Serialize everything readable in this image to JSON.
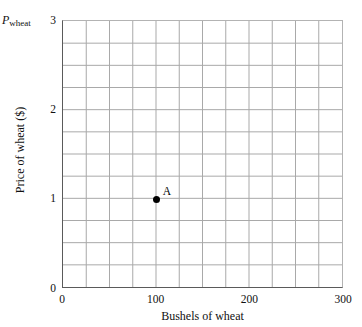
{
  "figure": {
    "corner_label": {
      "symbol": "P",
      "subscript": "wheat"
    },
    "axis_titles": {
      "x": "Bushels of wheat",
      "y": "Price of wheat ($)"
    }
  },
  "chart_data": {
    "type": "scatter",
    "title": "",
    "subtitle": "",
    "xlabel": "Bushels of wheat",
    "ylabel": "Price of wheat ($)",
    "corner_axis_symbol": "P_wheat",
    "xlim": [
      0,
      300
    ],
    "ylim": [
      0,
      3
    ],
    "xticks": [
      0,
      100,
      200,
      300
    ],
    "xtick_labels": [
      "0",
      "100",
      "200",
      "300"
    ],
    "yticks": [
      0,
      1,
      2,
      3
    ],
    "ytick_labels": [
      "0",
      "1",
      "2",
      "3"
    ],
    "grid": true,
    "grid_x_step": 25,
    "grid_y_step": 0.25,
    "grid_color": "#a8a8a8",
    "axis_color": "#5a5a5a",
    "legend": null,
    "legend_position": "none",
    "points": [
      {
        "label": "A",
        "x": 100,
        "y": 1,
        "color": "#000000",
        "marker": "circle"
      }
    ],
    "series": [
      {
        "name": "A",
        "x": [
          100
        ],
        "values": [
          1
        ]
      }
    ]
  }
}
